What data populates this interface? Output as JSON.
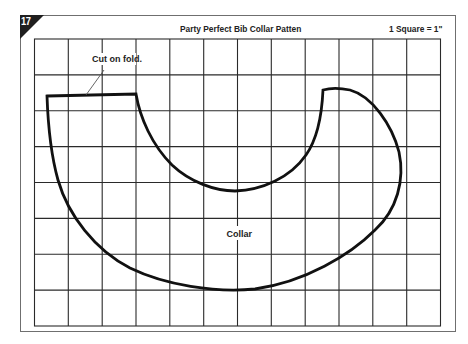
{
  "figure": {
    "badge_number": "17",
    "title": "Party Perfect Bib Collar Patten",
    "scale_note": "1 Square = 1\"",
    "grid": {
      "columns": 12,
      "rows": 8,
      "square_size": "1 inch"
    },
    "labels": {
      "fold": "Cut on fold.",
      "piece": "Collar"
    },
    "colors": {
      "badge": "#1f1f1f",
      "grid_line": "#2a2a2a",
      "outline": "#111111",
      "frame": "#6f6f6f",
      "background": "#ffffff"
    }
  }
}
